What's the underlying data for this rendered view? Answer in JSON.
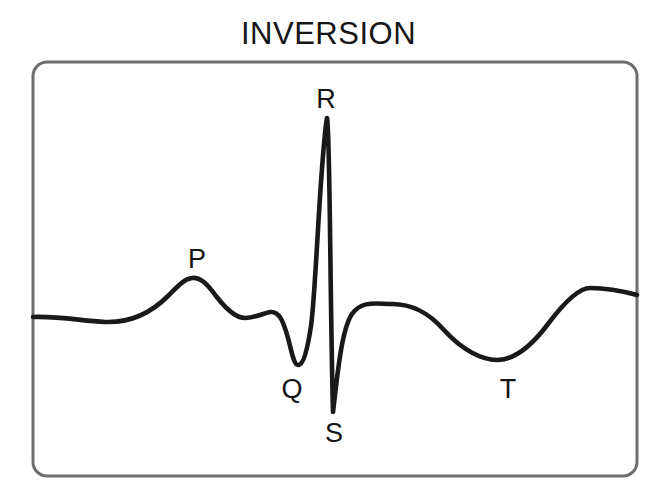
{
  "title": "INVERSION",
  "figure": {
    "name": "ecg-waveform-diagram",
    "background_color": "#ffffff",
    "frame": {
      "x": 33,
      "y": 62,
      "width": 604,
      "height": 414,
      "corner_radius": 14,
      "stroke_color": "#6e6e6e",
      "stroke_width": 3
    },
    "trace": {
      "stroke_color": "#191919",
      "stroke_width": 4.6
    }
  },
  "labels": [
    {
      "id": "p-wave-label",
      "text": "P",
      "x": 197,
      "y": 268
    },
    {
      "id": "q-wave-label",
      "text": "Q",
      "x": 292,
      "y": 398
    },
    {
      "id": "r-wave-label",
      "text": "R",
      "x": 326,
      "y": 108
    },
    {
      "id": "s-wave-label",
      "text": "S",
      "x": 334,
      "y": 442
    },
    {
      "id": "t-wave-label",
      "text": "T",
      "x": 508,
      "y": 398
    }
  ],
  "chart_data": {
    "type": "line",
    "title": "INVERSION",
    "xlabel": "",
    "ylabel": "",
    "grid": false,
    "legend": null,
    "baseline_y_px": 317,
    "xlim_px": [
      33,
      637
    ],
    "ylim_px": [
      62,
      476
    ],
    "annotations": [
      "P",
      "Q",
      "R",
      "S",
      "T"
    ],
    "features": [
      {
        "name": "baseline-start",
        "x": 33,
        "y": 317
      },
      {
        "name": "baseline-dip",
        "x": 105,
        "y": 322
      },
      {
        "name": "P-peak",
        "x": 192,
        "y": 278
      },
      {
        "name": "PR-trough",
        "x": 245,
        "y": 318
      },
      {
        "name": "PR-bump",
        "x": 270,
        "y": 312
      },
      {
        "name": "Q-trough",
        "x": 297,
        "y": 365
      },
      {
        "name": "R-peak",
        "x": 327,
        "y": 118
      },
      {
        "name": "S-trough",
        "x": 333,
        "y": 412
      },
      {
        "name": "ST-plateau",
        "x": 392,
        "y": 304
      },
      {
        "name": "T-trough",
        "x": 497,
        "y": 360
      },
      {
        "name": "post-T-peak",
        "x": 590,
        "y": 288
      },
      {
        "name": "baseline-end",
        "x": 637,
        "y": 295
      }
    ],
    "path": "M 33,317 C 60,316 82,321 105,322 C 132,323 152,312 168,296 C 178,286 184,279 192,278 C 201,277 208,285 216,296 C 226,309 236,318 245,318 C 254,318 262,314 270,312 C 279,311 283,320 288,338 C 292,353 294,365 298,365 C 303,365 307,352 311,326 C 316,292 320,160 327,118 C 330,128 330,300 333,412 C 337,380 341,330 352,314 C 362,300 376,304 392,304 C 412,304 428,312 444,330 C 462,350 482,360 497,360 C 512,360 530,348 548,324 C 566,300 580,288 590,288 C 608,288 626,292 637,295"
  }
}
